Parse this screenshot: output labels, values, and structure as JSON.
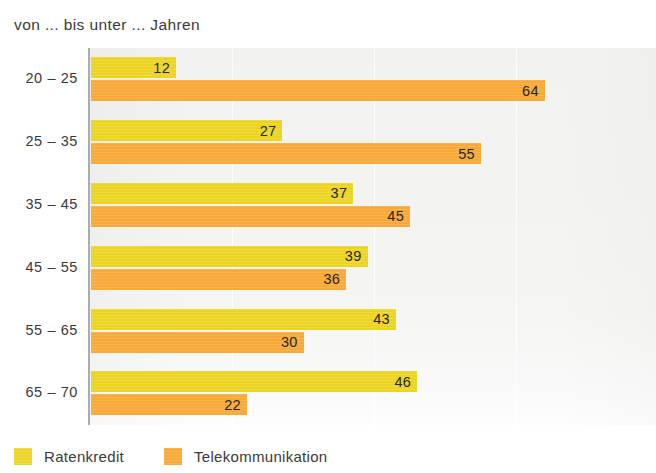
{
  "chart_data": {
    "type": "bar",
    "orientation": "horizontal",
    "title": "von ... bis unter ... Jahren",
    "xlabel": "",
    "ylabel": "",
    "categories": [
      "20 – 25",
      "25 – 35",
      "35 – 45",
      "45 – 55",
      "55 – 65",
      "65 – 70"
    ],
    "series": [
      {
        "name": "Ratenkredit",
        "color": "#ecd422",
        "values": [
          12,
          27,
          37,
          39,
          43,
          46
        ]
      },
      {
        "name": "Telekommunikation",
        "color": "#f9a937",
        "values": [
          64,
          55,
          45,
          36,
          30,
          22
        ]
      }
    ],
    "xlim": [
      0,
      80
    ],
    "grid": true,
    "gridlines": [
      20,
      40,
      60,
      80
    ],
    "legend_position": "bottom-left",
    "value_labels": true,
    "plot_background": "#f3f3f1"
  },
  "legend": {
    "items": [
      {
        "label": "Ratenkredit"
      },
      {
        "label": "Telekommunikation"
      }
    ]
  }
}
